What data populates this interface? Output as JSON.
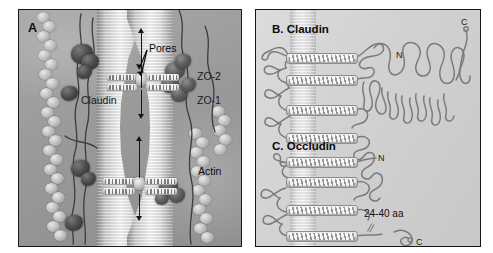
{
  "figure": {
    "background": "#ffffff",
    "panel_border_color": "#171717"
  },
  "panel_a": {
    "letter": "A",
    "caption_style": "grayscale 3D rendering of an epithelial tight junction",
    "labels": {
      "pores": "Pores",
      "claudin": "Claudin",
      "zo2": "ZO-2",
      "zo1": "ZO-1",
      "actin": "Actin"
    },
    "watermark": ""
  },
  "panel_b": {
    "title": "B. Claudin",
    "n_terminus": "N",
    "c_terminus": "C",
    "transmembrane_helix_count": 4
  },
  "panel_c": {
    "title": "C. Occludin",
    "n_terminus": "N",
    "c_terminus": "C",
    "tail_length_label": "24-40 aa",
    "break_symbol": "//",
    "transmembrane_helix_count": 4
  },
  "palette": {
    "panel_a_base": "#9d9d9d",
    "panel_bc_base": "#d2d2d2",
    "membrane_light": "#f7f7f7",
    "loop_stroke": "#7b7b7b",
    "zo_blob": "#4b4b4b",
    "text": "#101010"
  }
}
